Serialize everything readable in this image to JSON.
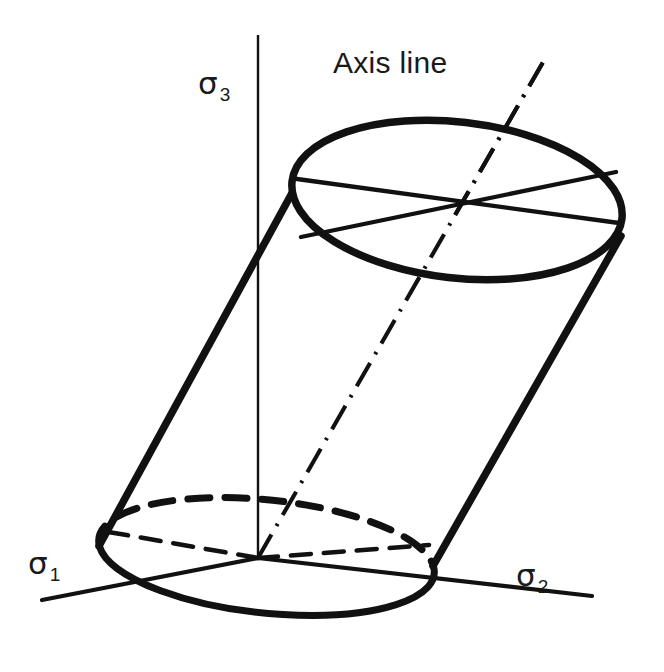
{
  "figure": {
    "background_color": "#ffffff",
    "stroke_color": "#111111",
    "labels": {
      "sigma1": "σ",
      "sigma1_sub": "1",
      "sigma2": "σ",
      "sigma2_sub": "2",
      "sigma3": "σ",
      "sigma3_sub": "3",
      "axis_line": "Axis line"
    },
    "geometry": {
      "origin": {
        "x": 258,
        "y": 558
      },
      "sigma3_axis": {
        "x1": 258,
        "y1": 35,
        "x2": 258,
        "y2": 558,
        "stroke_width": 2.2,
        "style": "solid"
      },
      "sigma1_axis": {
        "x1": 42,
        "y1": 600,
        "x2": 258,
        "y2": 558,
        "stroke_width": 4.2,
        "style": "solid"
      },
      "sigma2_axis": {
        "x1": 258,
        "y1": 558,
        "x2": 592,
        "y2": 596,
        "stroke_width": 4.2,
        "style": "solid"
      },
      "axis_line": {
        "x1": 258,
        "y1": 558,
        "x2": 546,
        "y2": 57,
        "stroke_width": 4.0,
        "style": "dash-dot"
      },
      "top_ellipse": {
        "cx": 457,
        "cy": 200,
        "rx": 166,
        "ry": 78,
        "rotation_deg": 6.5,
        "stroke_width": 7.5,
        "style": "solid"
      },
      "bottom_ellipse": {
        "cx": 265,
        "cy": 565,
        "rx": 167,
        "ry": 56,
        "rotation_deg": 6.0,
        "front_style": "solid",
        "back_style": "dashed",
        "stroke_width": 7.0
      },
      "left_wall": {
        "x1": 292,
        "y1": 193,
        "x2": 99,
        "y2": 546,
        "stroke_width": 7.5
      },
      "right_wall": {
        "x1": 621,
        "y1": 236,
        "x2": 433,
        "y2": 566,
        "stroke_width": 7.5
      },
      "top_chords": [
        {
          "x1": 296,
          "y1": 178,
          "x2": 620,
          "y2": 224,
          "stroke_width": 4.2
        },
        {
          "x1": 300,
          "y1": 237,
          "x2": 617,
          "y2": 171,
          "stroke_width": 4.2
        }
      ],
      "bottom_chords": [
        {
          "x1": 258,
          "y1": 558,
          "x2": 103,
          "y2": 530,
          "stroke_width": 4.6,
          "style": "dashed"
        },
        {
          "x1": 258,
          "y1": 558,
          "x2": 430,
          "y2": 545,
          "stroke_width": 4.6,
          "style": "dashed"
        }
      ]
    }
  }
}
